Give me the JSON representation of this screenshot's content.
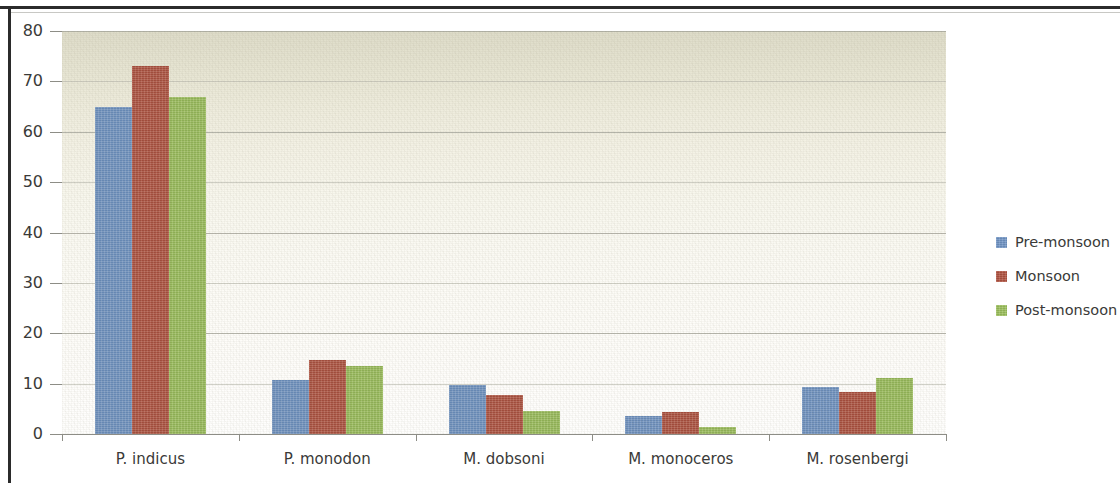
{
  "chart_data": {
    "type": "bar",
    "title": "",
    "xlabel": "",
    "ylabel": "",
    "ylim": [
      0,
      80
    ],
    "ytick_step": 10,
    "yticks": [
      "0",
      "10",
      "20",
      "30",
      "40",
      "50",
      "60",
      "70",
      "80"
    ],
    "grid": true,
    "legend_position": "right",
    "categories": [
      "P. indicus",
      "P. monodon",
      "M. dobsoni",
      "M. monoceros",
      "M. rosenbergi"
    ],
    "series": [
      {
        "name": "Pre-monsoon",
        "color": "#7195c6",
        "values": [
          65.0,
          10.8,
          9.8,
          3.5,
          9.3
        ]
      },
      {
        "name": "Monsoon",
        "color": "#b15341",
        "values": [
          73.0,
          14.7,
          7.8,
          4.4,
          8.4
        ]
      },
      {
        "name": "Post-monsoon",
        "color": "#9cc05c",
        "values": [
          67.0,
          13.5,
          4.5,
          1.3,
          11.2
        ]
      }
    ]
  },
  "legend": {
    "items": [
      {
        "label": "Pre-monsoon",
        "color": "#7195c6"
      },
      {
        "label": "Monsoon",
        "color": "#b15341"
      },
      {
        "label": "Post-monsoon",
        "color": "#9cc05c"
      }
    ]
  },
  "colors": {
    "pre_monsoon": "#7195c6",
    "monsoon": "#b15341",
    "post_monsoon": "#9cc05c",
    "plot_background_top": "#dedcc9",
    "plot_background_bottom": "#fefefd",
    "gridline": "#a9a9a0",
    "axis": "#8d8d86",
    "frame": "#2b2b2b",
    "text": "#3a3a38",
    "page_background": "#ffffff"
  }
}
